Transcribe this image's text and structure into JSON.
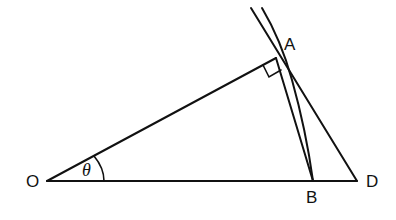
{
  "diagram": {
    "labels": {
      "O": "O",
      "A": "A",
      "B": "B",
      "D": "D",
      "angle": "θ"
    },
    "points": {
      "O": [
        47,
        181
      ],
      "A": [
        276,
        58
      ],
      "B": [
        313,
        181
      ],
      "D": [
        357,
        181
      ]
    },
    "colors": {
      "stroke": "#111111",
      "background": "#ffffff"
    }
  }
}
